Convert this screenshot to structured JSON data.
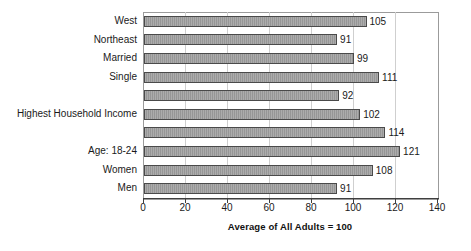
{
  "chart_data": {
    "type": "bar",
    "orientation": "horizontal",
    "title": "",
    "xlabel": "Average of All Adults = 100",
    "ylabel": "",
    "categories": [
      "West",
      "Northeast",
      "Married",
      "Single",
      "",
      "Highest Household Income",
      "",
      "Age: 18-24",
      "Women",
      "Men"
    ],
    "values": [
      105,
      91,
      99,
      111,
      92,
      102,
      114,
      121,
      108,
      91
    ],
    "xlim": [
      0,
      140
    ],
    "x_ticks": [
      0,
      20,
      40,
      60,
      80,
      100,
      120,
      140
    ],
    "grid": true,
    "legend": "none",
    "colors": {
      "bar_fill": "#9e9e9e",
      "bar_border": "#4a4a4a",
      "gridline": "#cfcfcf",
      "plot_border": "#9b9b9b",
      "axis": "#3f3f3f",
      "text": "#1a1a1a",
      "background": "#ffffff"
    }
  }
}
